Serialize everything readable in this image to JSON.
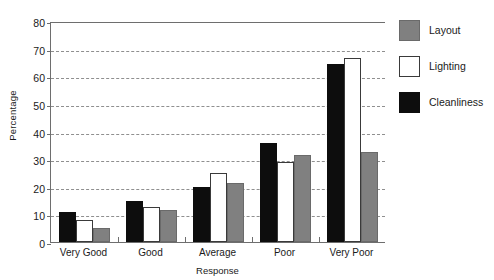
{
  "chart_data": {
    "type": "bar",
    "title": "",
    "xlabel": "Response",
    "ylabel": "Percentage",
    "categories": [
      "Very Good",
      "Good",
      "Average",
      "Poor",
      "Very Poor"
    ],
    "series": [
      {
        "name": "Cleanliness",
        "color": "#0d0d0d",
        "values": [
          11,
          15,
          20,
          36,
          64.5
        ]
      },
      {
        "name": "Lighting",
        "color": "#ffffff",
        "values": [
          8,
          12.5,
          25,
          29,
          66.5
        ]
      },
      {
        "name": "Layout",
        "color": "#808080",
        "values": [
          5,
          11.5,
          21.5,
          31.5,
          32.5
        ]
      }
    ],
    "series_order_in_bars": [
      "Cleanliness",
      "Lighting",
      "Layout"
    ],
    "ylim": [
      0,
      80
    ],
    "ytick_labels": [
      "0",
      "10",
      "20",
      "30",
      "40",
      "50",
      "60",
      "70",
      "80"
    ],
    "ytick_values": [
      0,
      10,
      20,
      30,
      40,
      50,
      60,
      70,
      80
    ],
    "grid": true,
    "grid_style": "dashed-horizontal",
    "legend_position": "right",
    "legend_entries": [
      {
        "label": "Layout",
        "swatch": "layout"
      },
      {
        "label": "Lighting",
        "swatch": "lighting"
      },
      {
        "label": "Cleanliness",
        "swatch": "cleanliness"
      }
    ]
  }
}
